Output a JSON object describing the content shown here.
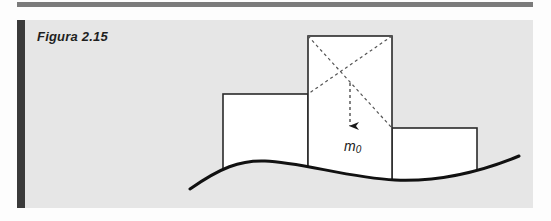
{
  "figure": {
    "caption": "Figura 2.15",
    "mass_symbol": "m",
    "mass_subscript": "0"
  },
  "diagram": {
    "blocks": [
      {
        "name": "left-block",
        "x": 223,
        "y": 94,
        "w": 85,
        "h": 74
      },
      {
        "name": "center-block",
        "x": 308,
        "y": 36,
        "w": 84,
        "h": 145
      },
      {
        "name": "right-block",
        "x": 392,
        "y": 128,
        "w": 85,
        "h": 52
      }
    ],
    "center_of_mass": {
      "x": 350,
      "y": 83
    },
    "weight_arrow": {
      "from_y": 83,
      "to_y": 130
    },
    "ground_curve": "M 190 189 C 220 168, 240 160, 265 161 C 300 162, 350 178, 395 180 C 440 182, 480 172, 519 156",
    "colors": {
      "panel": "#e6e6e6",
      "accent_bar": "#3a3a3a",
      "top_rule": "#7b7b7b",
      "block_fill": "#ffffff",
      "stroke": "#2a2a2a"
    }
  }
}
